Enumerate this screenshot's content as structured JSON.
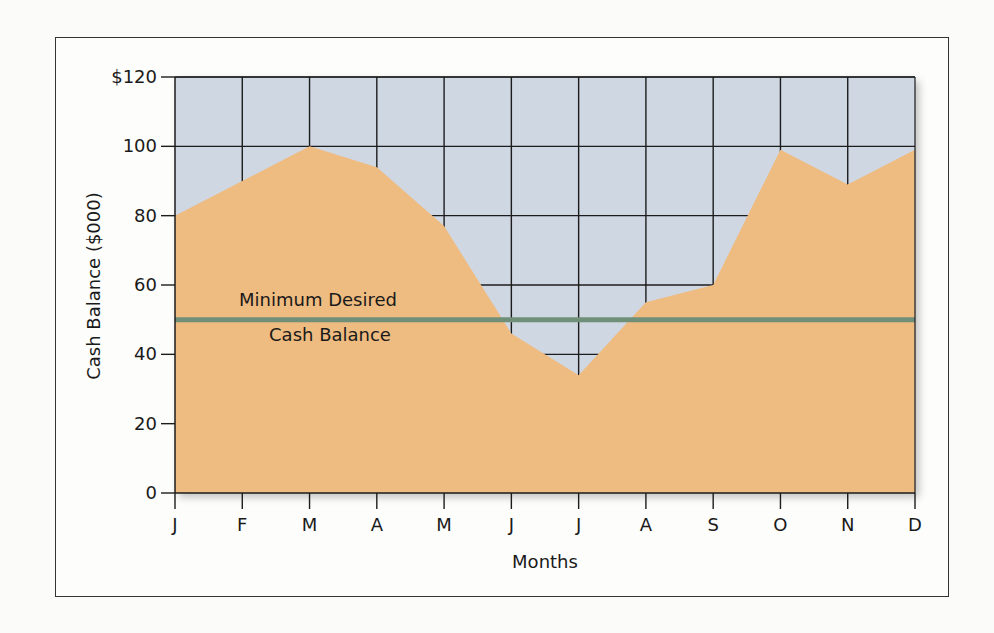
{
  "chart_data": {
    "type": "area",
    "title": "",
    "xlabel": "Months",
    "ylabel": "Cash Balance ($000)",
    "categories": [
      "J",
      "F",
      "M",
      "A",
      "M",
      "J",
      "J",
      "A",
      "S",
      "O",
      "N",
      "D"
    ],
    "series": [
      {
        "name": "Cash Balance",
        "values": [
          80,
          90,
          100,
          94,
          77,
          46,
          34,
          55,
          60,
          99,
          89,
          99
        ],
        "color": "#eebb80"
      }
    ],
    "reference_lines": [
      {
        "name": "Minimum Desired Cash Balance",
        "value": 50,
        "color": "#6f8f78"
      }
    ],
    "ylim": [
      0,
      120
    ],
    "yticks": [
      0,
      20,
      40,
      60,
      80,
      100,
      120
    ],
    "ytick_labels": [
      "0",
      "20",
      "40",
      "60",
      "80",
      "100",
      "$120"
    ],
    "grid": true,
    "plot_background": "#cfd7e3",
    "legend": null
  },
  "annotation": {
    "line1": "Minimum Desired",
    "line2": "Cash Balance"
  },
  "axes": {
    "x_title": "Months",
    "y_title": "Cash Balance ($000)"
  }
}
